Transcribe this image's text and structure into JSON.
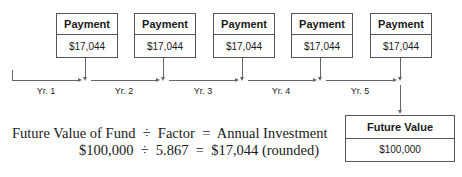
{
  "payments": [
    {
      "label": "Payment",
      "amount": "$17,044"
    },
    {
      "label": "Payment",
      "amount": "$17,044"
    },
    {
      "label": "Payment",
      "amount": "$17,044"
    },
    {
      "label": "Payment",
      "amount": "$17,044"
    },
    {
      "label": "Payment",
      "amount": "$17,044"
    }
  ],
  "years": [
    "Yr. 1",
    "Yr. 2",
    "Yr. 3",
    "Yr. 4",
    "Yr. 5"
  ],
  "future_value": {
    "label": "Future Value",
    "amount": "$100,000"
  },
  "formula": {
    "line1": "Future Value of Fund  ÷  Factor  =  Annual Investment",
    "line2": "$100,000  ÷  5.867  =  $17,044 (rounded)"
  }
}
